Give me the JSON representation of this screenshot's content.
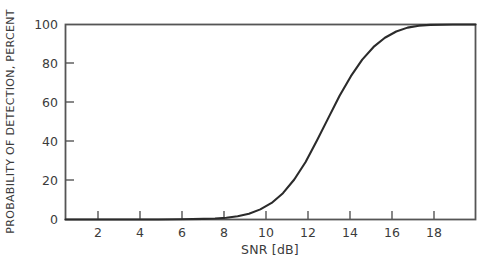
{
  "chart_data": {
    "type": "line",
    "title": "",
    "xlabel": "SNR [dB]",
    "ylabel": "PROBABILITY OF DETECTION, PERCENT",
    "xlim": [
      0.9,
      19.0
    ],
    "ylim": [
      0,
      100
    ],
    "grid": false,
    "legend": null,
    "xticks": [
      2,
      4,
      6,
      8,
      10,
      12,
      14,
      16,
      18
    ],
    "xtick_labels": [
      "2",
      "4",
      "6",
      "8",
      "10",
      "12",
      "14",
      "16",
      "18"
    ],
    "yticks": [
      0,
      20,
      40,
      60,
      80,
      100
    ],
    "ytick_labels": [
      "0",
      "20",
      "40",
      "60",
      "80",
      "100"
    ],
    "series": [
      {
        "name": "probability of detection",
        "color": "#2b2b2b",
        "line_width": 2.1,
        "x": [
          0.9,
          2.0,
          3.0,
          4.0,
          5.0,
          6.0,
          7.0,
          7.5,
          8.0,
          8.5,
          9.0,
          9.5,
          10.0,
          10.5,
          11.0,
          11.5,
          12.0,
          12.5,
          13.0,
          13.5,
          14.0,
          14.5,
          15.0,
          15.5,
          16.0,
          16.5,
          17.0,
          18.0,
          19.0
        ],
        "y": [
          0.0,
          0.0,
          0.0,
          0.0,
          0.0,
          0.1,
          0.3,
          0.5,
          0.9,
          1.7,
          3.0,
          5.2,
          8.5,
          13.5,
          20.5,
          29.5,
          40.5,
          52.0,
          63.5,
          73.5,
          82.0,
          88.5,
          93.2,
          96.4,
          98.4,
          99.4,
          99.8,
          100.0,
          100.0
        ]
      }
    ],
    "annotations": []
  },
  "colors": {
    "axis": "#555555",
    "curve": "#2b2b2b",
    "text": "#3b3b3b",
    "background": "#ffffff"
  },
  "axis_titles": {
    "x": "SNR [dB]",
    "y": "PROBABILITY OF DETECTION, PERCENT"
  }
}
